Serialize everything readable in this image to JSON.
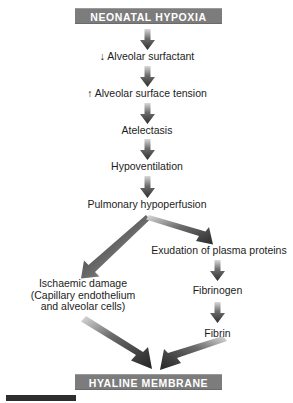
{
  "diagram": {
    "title": "NEONATAL HYPOXIA",
    "outcome": "HYALINE MEMBRANE",
    "banner_color": "#7c7c7c",
    "banner_text_color": "#ffffff",
    "text_color": "#1c1c1c",
    "arrow_color_dark": "#3a3a3a",
    "arrow_color_light": "#d8d8d8",
    "background": "#ffffff",
    "nodes": {
      "alveolar_surfactant": "↓ Alveolar surfactant",
      "alveolar_surface_tension": "↑ Alveolar surface tension",
      "atelectasis": "Atelectasis",
      "hypoventilation": "Hypoventilation",
      "pulmonary_hypoperfusion": "Pulmonary hypoperfusion",
      "ischaemic_damage_line1": "Ischaemic damage",
      "ischaemic_damage_line2": "(Capillary endothelium",
      "ischaemic_damage_line3": "and alveolar cells)",
      "exudation_plasma_proteins": "Exudation of plasma proteins",
      "fibrinogen": "Fibrinogen",
      "fibrin": "Fibrin"
    },
    "edges": [
      {
        "from": "NEONATAL HYPOXIA",
        "to": "↓ Alveolar surfactant",
        "style": "vertical"
      },
      {
        "from": "↓ Alveolar surfactant",
        "to": "↑ Alveolar surface tension",
        "style": "vertical"
      },
      {
        "from": "↑ Alveolar surface tension",
        "to": "Atelectasis",
        "style": "vertical"
      },
      {
        "from": "Atelectasis",
        "to": "Hypoventilation",
        "style": "vertical"
      },
      {
        "from": "Hypoventilation",
        "to": "Pulmonary hypoperfusion",
        "style": "vertical"
      },
      {
        "from": "Pulmonary hypoperfusion",
        "to": "Ischaemic damage",
        "style": "diagonal-left"
      },
      {
        "from": "Pulmonary hypoperfusion",
        "to": "Exudation of plasma proteins",
        "style": "diagonal-right"
      },
      {
        "from": "Exudation of plasma proteins",
        "to": "Fibrinogen",
        "style": "vertical"
      },
      {
        "from": "Fibrinogen",
        "to": "Fibrin",
        "style": "vertical"
      },
      {
        "from": "Ischaemic damage",
        "to": "HYALINE MEMBRANE",
        "style": "diagonal-right-down"
      },
      {
        "from": "Fibrin",
        "to": "HYALINE MEMBRANE",
        "style": "diagonal-left-down"
      }
    ]
  }
}
